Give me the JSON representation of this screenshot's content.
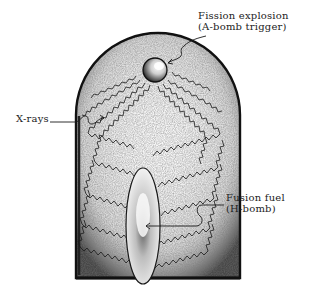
{
  "diagram": {
    "type": "hydrogen-bomb-schematic",
    "labels": {
      "fission_line1": "Fission explosion",
      "fission_line2": "(A-bomb trigger)",
      "xrays": "X-rays",
      "fusion_line1": "Fusion fuel",
      "fusion_line2": "(H-bomb)"
    },
    "components": [
      {
        "name": "casing",
        "shape": "arched-rectangle"
      },
      {
        "name": "fission-primary",
        "shape": "sphere"
      },
      {
        "name": "fusion-secondary",
        "shape": "ellipse"
      },
      {
        "name": "x-ray-paths",
        "shape": "zigzag-lines"
      }
    ],
    "colors": {
      "ink": "#1a1a1a",
      "stipple": "#8a8a8a",
      "background": "#ffffff"
    }
  }
}
